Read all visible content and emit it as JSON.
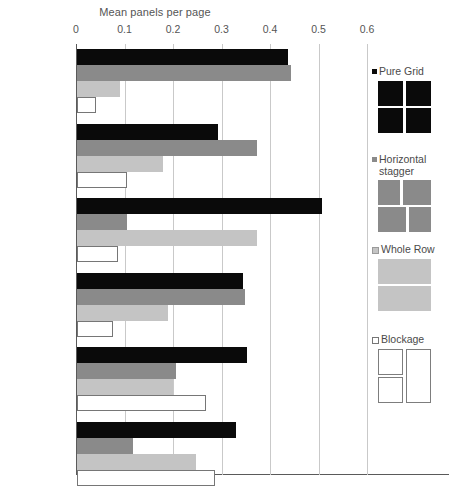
{
  "chart_data": {
    "type": "bar",
    "orientation": "horizontal",
    "title": "Mean panels per page",
    "xlabel": "",
    "ylabel": "",
    "xlim": [
      0,
      0.6
    ],
    "xticks": [
      0,
      0.1,
      0.2,
      0.3,
      0.4,
      0.5,
      0.6
    ],
    "xticklabels": [
      "0",
      "0.1",
      "0.2",
      "0.3",
      "0.4",
      "0.5",
      "0.6"
    ],
    "grid": true,
    "legend_position": "right",
    "categories": [
      "Swedish",
      "French",
      "USA\nMainstream",
      "USA Indy",
      "Japanese",
      "Hong Kong"
    ],
    "series": [
      {
        "name": "Pure Grid",
        "color": "#0a0a0a",
        "values": [
          0.435,
          0.291,
          0.505,
          0.342,
          0.351,
          0.328
        ]
      },
      {
        "name": "Horizontal stagger",
        "color": "#8a8a8a",
        "values": [
          0.441,
          0.371,
          0.103,
          0.346,
          0.204,
          0.115
        ]
      },
      {
        "name": "Whole Row",
        "color": "#c4c4c4",
        "values": [
          0.089,
          0.177,
          0.371,
          0.188,
          0.198,
          0.245
        ]
      },
      {
        "name": "Blockage",
        "color": "#ffffff",
        "values": [
          0.039,
          0.103,
          0.084,
          0.074,
          0.266,
          0.284
        ]
      }
    ]
  },
  "legend": {
    "items": [
      {
        "label": "Pure  Grid",
        "swatch": "sw-black",
        "glyph": "pure-grid"
      },
      {
        "label": "Horizontal\nstagger",
        "swatch": "sw-dark",
        "glyph": "horizontal-stagger"
      },
      {
        "label": "Whole Row",
        "swatch": "sw-light",
        "glyph": "whole-row"
      },
      {
        "label": "Blockage",
        "swatch": "sw-white",
        "glyph": "blockage"
      }
    ]
  }
}
